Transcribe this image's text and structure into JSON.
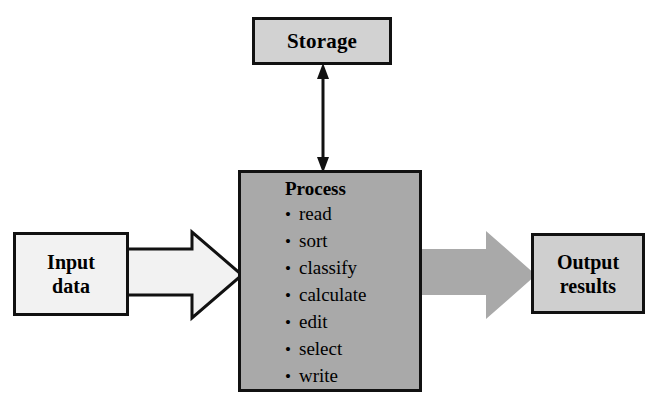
{
  "diagram": {
    "colors": {
      "process_fill": "#a9a9a9",
      "storage_fill": "#d2d2d2",
      "output_fill": "#cfcfcf",
      "input_fill": "#f2f2f2",
      "outline": "#111111",
      "output_arrow_fill": "#a9a9a9",
      "input_arrow_fill": "#f2f2f2"
    },
    "nodes": {
      "storage": {
        "label": "Storage"
      },
      "process": {
        "title": "Process",
        "bullet_glyph": "•",
        "items": [
          "read",
          "sort",
          "classify",
          "calculate",
          "edit",
          "select",
          "write"
        ]
      },
      "input": {
        "line1": "Input",
        "line2": "data"
      },
      "output": {
        "line1": "Output",
        "line2": "results"
      }
    },
    "connectors": {
      "storage_process": {
        "name": "double-headed-arrow",
        "direction": "bidirectional"
      },
      "input_process": {
        "name": "block-arrow",
        "direction": "right"
      },
      "process_output": {
        "name": "block-arrow",
        "direction": "right"
      }
    }
  }
}
